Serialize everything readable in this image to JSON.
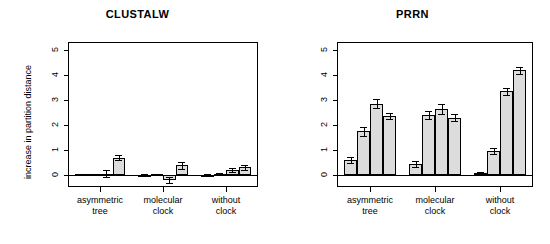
{
  "figure": {
    "ylabel": "increase in partition distance",
    "y_ticks": [
      "0",
      "1",
      "2",
      "3",
      "4",
      "5"
    ],
    "group_labels_line1": [
      "asymmetric",
      "molecular",
      "without"
    ],
    "group_labels_line2": [
      "tree",
      "clock",
      "clock"
    ],
    "bar_color": "#dcdcdc",
    "line_color": "#000000"
  },
  "chart_data": [
    {
      "type": "bar",
      "title": "CLUSTALW",
      "xlabel": "",
      "ylabel": "increase in partition distance",
      "ylim": [
        -0.45,
        5.3
      ],
      "yticks": [
        0,
        1,
        2,
        3,
        4,
        5
      ],
      "grid": false,
      "legend": "none",
      "categories": [
        "asymmetric tree",
        "molecular clock",
        "without clock"
      ],
      "bars_per_category": 4,
      "values": [
        [
          0.02,
          0.02,
          0.05,
          0.68
        ],
        [
          0.01,
          0.02,
          -0.21,
          0.38
        ],
        [
          0.01,
          0.03,
          0.2,
          0.3
        ]
      ],
      "errors": [
        [
          0.02,
          0.02,
          0.14,
          0.1
        ],
        [
          0.02,
          0.02,
          0.12,
          0.14
        ],
        [
          0.02,
          0.03,
          0.09,
          0.11
        ]
      ]
    },
    {
      "type": "bar",
      "title": "PRRN",
      "xlabel": "",
      "ylabel": "",
      "ylim": [
        -0.45,
        5.3
      ],
      "yticks": [
        0,
        1,
        2,
        3,
        4,
        5
      ],
      "grid": false,
      "legend": "none",
      "categories": [
        "asymmetric tree",
        "molecular clock",
        "without clock"
      ],
      "bars_per_category": 4,
      "values": [
        [
          0.6,
          1.75,
          2.85,
          2.35
        ],
        [
          0.45,
          2.4,
          2.65,
          2.3
        ],
        [
          0.08,
          0.95,
          3.35,
          4.2
        ]
      ],
      "errors": [
        [
          0.13,
          0.18,
          0.18,
          0.12
        ],
        [
          0.12,
          0.17,
          0.2,
          0.13
        ],
        [
          0.04,
          0.13,
          0.16,
          0.13
        ]
      ]
    }
  ]
}
